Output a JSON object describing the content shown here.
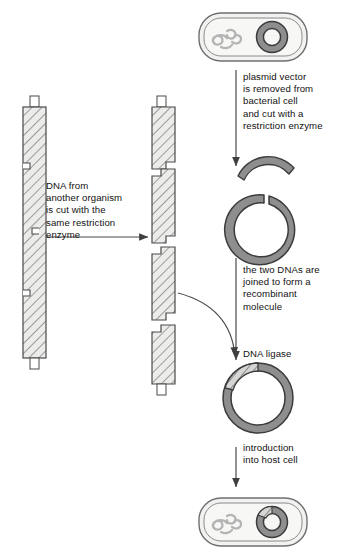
{
  "diagram": {
    "captions": {
      "plasmid_vector": "plasmid vector\nis removed from\nbacterial cell\nand cut with a\nrestriction enzyme",
      "donor_dna": "DNA from\nanother organism\nis cut with the\nsame restriction\nenzyme",
      "join_dnas": "the two DNAs are\njoined to form a\nrecombinant\nmolecule",
      "dna_ligase": "DNA ligase",
      "introduction": "introduction\ninto host cell"
    },
    "nodes": {
      "bacterial_cell_top": "bacterial cell with chromosome and plasmid",
      "cut_plasmid": "plasmid cut open by restriction enzyme",
      "excised_arc": "excised plasmid fragment",
      "donor_dna_intact": "intact donor DNA molecule",
      "donor_dna_fragments": "donor DNA cut into four fragments with sticky ends",
      "recombinant_plasmid": "recombinant plasmid with inserted DNA",
      "host_cell_bottom": "host cell containing recombinant plasmid"
    },
    "colors": {
      "plasmid_fill": "#8e8e8e",
      "plasmid_stroke": "#3b3b3b",
      "cell_fill": "#f2f2f0",
      "cell_stroke": "#6f6f6f",
      "chromosome": "#b6b6b6",
      "dna_fill": "#ececeb",
      "dna_stroke": "#4a4a4a",
      "arrow": "#4a4a4a",
      "text": "#111111"
    }
  }
}
